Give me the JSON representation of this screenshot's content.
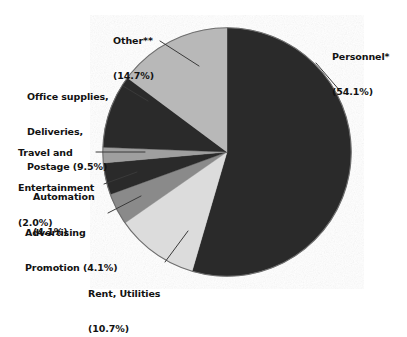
{
  "chart_data": {
    "type": "pie",
    "title": "",
    "subtitle": "",
    "xlabel": "",
    "ylabel": "",
    "legend_position": "callout-labels",
    "grid": false,
    "units": "percent",
    "total": 99.2,
    "start_angle_deg": 0,
    "direction": "clockwise",
    "categories": [
      "Personnel*",
      "Rent, Utilities",
      "Advertising Promotion",
      "Automation",
      "Travel and Entertainment",
      "Office supplies, Deliveries, Postage",
      "Other**"
    ],
    "values": [
      54.1,
      10.7,
      4.1,
      4.1,
      2.0,
      9.5,
      14.7
    ],
    "slices": [
      {
        "name": "personnel",
        "label": "Personnel*",
        "value": 54.1,
        "value_text": "(54.1%)",
        "color": "#2b2b2b"
      },
      {
        "name": "rent-utilities",
        "label": "Rent, Utilities",
        "value": 10.7,
        "value_text": "(10.7%)",
        "color": "#dcdcdc"
      },
      {
        "name": "advertising-promotion",
        "label": "Advertising Promotion",
        "value": 4.1,
        "value_text": "(4.1%)",
        "color": "#8a8a8a"
      },
      {
        "name": "automation",
        "label": "Automation",
        "value": 4.1,
        "value_text": "(4.1%)",
        "color": "#2b2b2b"
      },
      {
        "name": "travel-entertainment",
        "label": "Travel and Entertainment",
        "value": 2.0,
        "value_text": "(2.0%)",
        "color": "#9f9f9f"
      },
      {
        "name": "office-supplies",
        "label": "Office supplies, Deliveries, Postage",
        "value": 9.5,
        "value_text": "(9.5%)",
        "color": "#2b2b2b"
      },
      {
        "name": "other",
        "label": "Other**",
        "value": 14.7,
        "value_text": "(14.7%)",
        "color": "#b8b8b8"
      }
    ]
  },
  "callouts": {
    "personnel": {
      "line1": "Personnel*",
      "line2": "(54.1%)"
    },
    "other": {
      "line1": "Other**",
      "line2": "(14.7%)"
    },
    "office_supplies": {
      "line1": "Office supplies,",
      "line2": "Deliveries,",
      "line3": "Postage (9.5%)"
    },
    "travel": {
      "line1": "Travel and",
      "line2": "Entertainment",
      "line3": "(2.0%)"
    },
    "automation": {
      "line1": "Automation",
      "line2": "(4.1%)"
    },
    "advertising": {
      "line1": "Advertising",
      "line2": "Promotion (4.1%)"
    },
    "rent": {
      "line1": "Rent, Utilities",
      "line2": "(10.7%)"
    }
  },
  "colors": {
    "background": "#ffffff",
    "text": "#121212",
    "leader_line": "#3a3a3a",
    "pie_outline": "#6e6e6e",
    "dark_slice": "#2b2b2b",
    "mid_slice": "#8a8a8a",
    "light_slice": "#b8b8b8",
    "lightest_slice": "#dcdcdc"
  }
}
